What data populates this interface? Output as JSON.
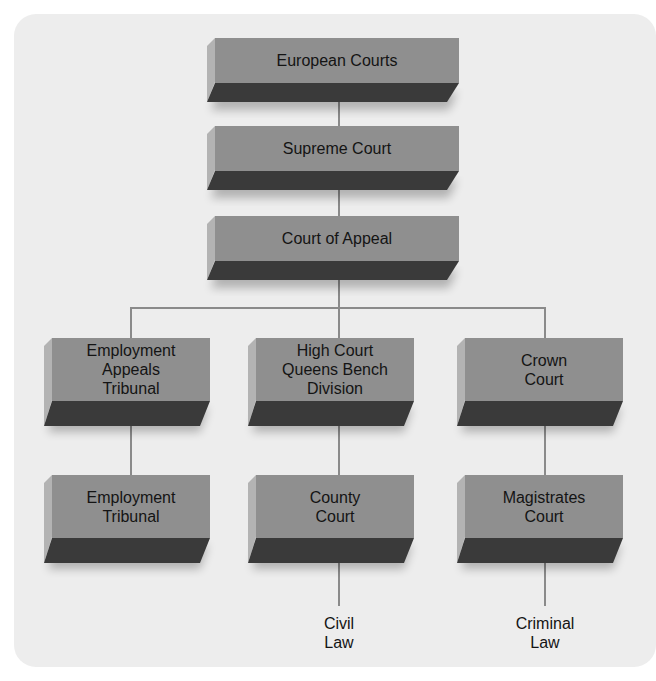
{
  "diagram": {
    "type": "hierarchy",
    "title": "",
    "colors": {
      "background": "#ffffff",
      "panel": "#ededed",
      "box_face": "#8f8f8f",
      "box_side": "#b3b3b3",
      "box_bottom": "#3a3a3a",
      "connector": "#8a8a8a",
      "text": "#141414"
    },
    "nodes": {
      "european_courts": "European Courts",
      "supreme_court": "Supreme Court",
      "court_of_appeal": "Court of Appeal",
      "employment_appeals_tribunal": "Employment\nAppeals\nTribunal",
      "high_court": "High Court\nQueens Bench\nDivision",
      "crown_court": "Crown\nCourt",
      "employment_tribunal": "Employment\nTribunal",
      "county_court": "County\nCourt",
      "magistrates_court": "Magistrates\nCourt"
    },
    "leaves": {
      "civil_law": "Civil\nLaw",
      "criminal_law": "Criminal\nLaw"
    },
    "edges": [
      [
        "European Courts",
        "Supreme Court"
      ],
      [
        "Supreme Court",
        "Court of Appeal"
      ],
      [
        "Court of Appeal",
        "Employment Appeals Tribunal"
      ],
      [
        "Court of Appeal",
        "High Court Queens Bench Division"
      ],
      [
        "Court of Appeal",
        "Crown Court"
      ],
      [
        "Employment Appeals Tribunal",
        "Employment Tribunal"
      ],
      [
        "High Court Queens Bench Division",
        "County Court"
      ],
      [
        "Crown Court",
        "Magistrates Court"
      ],
      [
        "County Court",
        "Civil Law"
      ],
      [
        "Magistrates Court",
        "Criminal Law"
      ]
    ]
  }
}
